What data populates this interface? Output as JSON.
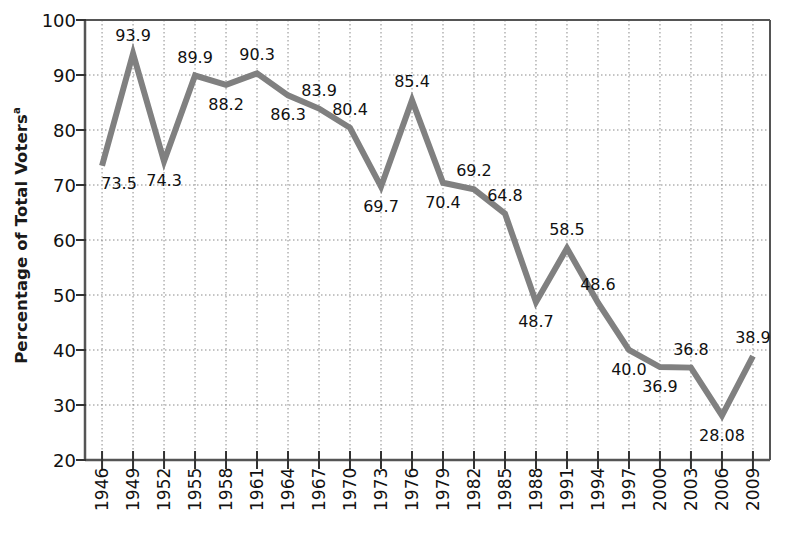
{
  "chart_data": {
    "type": "line",
    "title": "",
    "xlabel": "",
    "ylabel": "Percentage of Total Voters",
    "ylabel_superscript": "a",
    "ylim": [
      20,
      100
    ],
    "yticks": [
      100,
      90,
      80,
      70,
      60,
      50,
      40,
      30,
      20
    ],
    "grid": true,
    "grid_style": "dotted",
    "legend": "none",
    "line_color": "#808080",
    "line_width_px": 6,
    "categories": [
      "1946",
      "1949",
      "1952",
      "1955",
      "1958",
      "1961",
      "1964",
      "1967",
      "1970",
      "1973",
      "1976",
      "1979",
      "1982",
      "1985",
      "1988",
      "1991",
      "1994",
      "1997",
      "2000",
      "2003",
      "2006",
      "2009"
    ],
    "values": [
      73.5,
      93.9,
      74.3,
      89.9,
      88.2,
      90.3,
      86.3,
      83.9,
      80.4,
      69.7,
      85.4,
      70.4,
      69.2,
      64.8,
      48.7,
      58.5,
      48.6,
      40.0,
      36.9,
      36.8,
      28.08,
      38.9
    ],
    "value_labels": [
      "73.5",
      "93.9",
      "74.3",
      "89.9",
      "88.2",
      "90.3",
      "86.3",
      "83.9",
      "80.4",
      "69.7",
      "85.4",
      "70.4",
      "69.2",
      "64.8",
      "48.7",
      "58.5",
      "48.6",
      "40.0",
      "36.9",
      "36.8",
      "28.08",
      "38.9"
    ],
    "label_placement": [
      "below-right",
      "above",
      "below",
      "above",
      "below",
      "above",
      "below",
      "above",
      "above",
      "below",
      "above",
      "below",
      "above",
      "above",
      "below",
      "above",
      "above",
      "below",
      "below",
      "above",
      "below",
      "above"
    ]
  }
}
